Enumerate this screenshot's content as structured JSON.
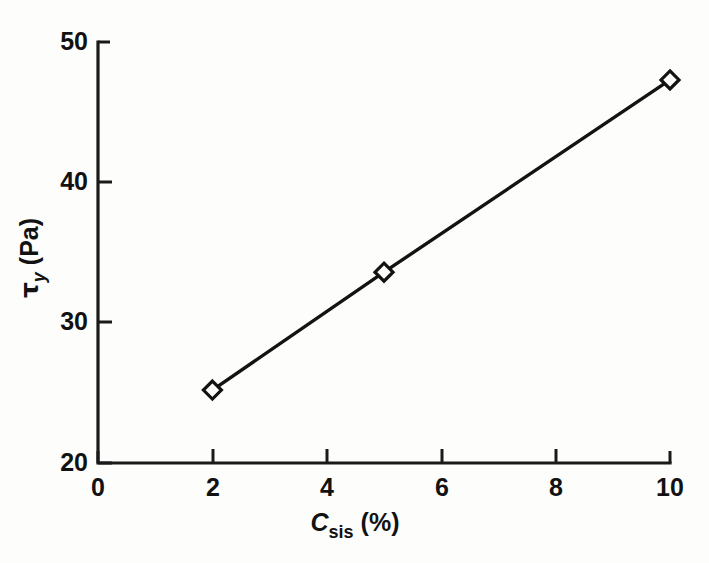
{
  "chart_data": {
    "type": "line",
    "title": "",
    "subtitle": "",
    "xlabel_parts": {
      "symbol": "C",
      "subscript": "sis",
      "units": "(%)"
    },
    "ylabel_parts": {
      "symbol": "τ",
      "subscript": "y",
      "units": "(Pa)"
    },
    "xlabel": "C_sis (%)",
    "ylabel": "τ_y (Pa)",
    "xlim": [
      0,
      10
    ],
    "ylim": [
      20,
      50
    ],
    "xticks": [
      "0",
      "2",
      "4",
      "6",
      "8",
      "10"
    ],
    "xtick_values": [
      0,
      2,
      4,
      6,
      8,
      10
    ],
    "yticks": [
      "20",
      "30",
      "40",
      "50"
    ],
    "ytick_values": [
      20,
      30,
      40,
      50
    ],
    "grid": false,
    "legend": false,
    "legend_position": "none",
    "marker_style": "open-diamond",
    "line_color": "#131313",
    "x": [
      2,
      5,
      10
    ],
    "values": [
      25.2,
      33.6,
      47.3
    ],
    "series": [
      {
        "name": "yield stress vs sisal concentration",
        "x": [
          2,
          5,
          10
        ],
        "values": [
          25.2,
          33.6,
          47.3
        ]
      }
    ],
    "annotations": []
  },
  "figure": {
    "background_color": "#fdfdfc",
    "ink_color": "#131313"
  }
}
